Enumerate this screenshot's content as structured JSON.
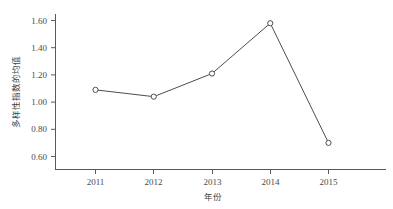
{
  "chart_data": {
    "type": "line",
    "title": "",
    "xlabel": "年份",
    "ylabel": "多样性指数的均值",
    "categories": [
      "2011",
      "2012",
      "2013",
      "2014",
      "2015"
    ],
    "values": [
      1.09,
      1.04,
      1.21,
      1.58,
      0.7
    ],
    "series": [
      {
        "name": "多样性指数的均值",
        "values": [
          1.09,
          1.04,
          1.21,
          1.58,
          0.7
        ]
      }
    ],
    "x": [
      2011,
      2012,
      2013,
      2014,
      2015
    ],
    "ylim": [
      0.6,
      1.6
    ],
    "xlim": [
      2010.4,
      2015.9
    ],
    "ytick_labels": [
      "0.60",
      "0.80",
      "1.00",
      "1.20",
      "1.40",
      "1.60"
    ],
    "ytick_values": [
      0.6,
      0.8,
      1.0,
      1.2,
      1.4,
      1.6
    ],
    "xtick_labels": [
      "2011",
      "2012",
      "2013",
      "2014",
      "2015"
    ],
    "grid": false,
    "legend": "none",
    "marker": "open-circle",
    "line_color": "#4d4d4d",
    "marker_face_color": "#ffffff",
    "axis_color": "#5a5a5a",
    "background_color": "#ffffff"
  },
  "axes": {
    "y_title": "多样性指数的均值",
    "x_title": "年份"
  },
  "ticks": {
    "y": [
      {
        "label": "1.60",
        "value": 1.6
      },
      {
        "label": "1.40",
        "value": 1.4
      },
      {
        "label": "1.20",
        "value": 1.2
      },
      {
        "label": "1.00",
        "value": 1.0
      },
      {
        "label": "0.80",
        "value": 0.8
      },
      {
        "label": "0.60",
        "value": 0.6
      }
    ],
    "x": [
      {
        "label": "2011",
        "value": 2011
      },
      {
        "label": "2012",
        "value": 2012
      },
      {
        "label": "2013",
        "value": 2013
      },
      {
        "label": "2014",
        "value": 2014
      },
      {
        "label": "2015",
        "value": 2015
      }
    ]
  }
}
